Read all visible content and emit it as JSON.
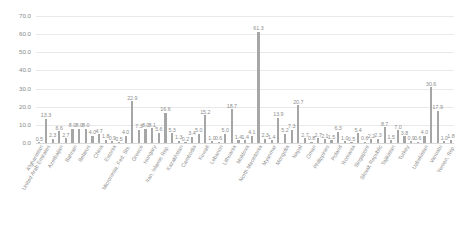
{
  "chart_data": {
    "type": "bar",
    "title": "",
    "subtitle": "",
    "xlabel": "",
    "ylabel": "",
    "ylim": [
      0,
      70
    ],
    "yticks": [
      "0.0",
      "10.0",
      "20.0",
      "30.0",
      "40.0",
      "50.0",
      "60.0",
      "70.0"
    ],
    "ytick_values": [
      0,
      10,
      20,
      30,
      40,
      50,
      60,
      70
    ],
    "grid": true,
    "legend": "none",
    "bar_color": "#a6a6a6",
    "grid_color": "#e9e9e9",
    "label_color": "#8d8d8d",
    "categories": [
      "Afghanistan",
      "United Arab Emirates",
      "Azerbaijan",
      "Bahrain",
      "Belarus",
      "China",
      "Estonia",
      "Micronesia, Fed. Sts.",
      "Greece",
      "Hungary",
      "Iran, Islamic Rep.",
      "Kazakhstan",
      "Cambodia",
      "Kuwait",
      "Lebanon",
      "Lithuania",
      "Moldova",
      "North Macedonia",
      "Myanmar",
      "Mongolia",
      "Nepal",
      "Oman",
      "Philippines",
      "Poland",
      "Romania",
      "Singapore",
      "Slovak Republic",
      "Tajikistan",
      "Turkey",
      "Uzbekistan",
      "Vanuatu",
      "Yemen, Rep."
    ],
    "values": [
      0.5,
      13.3,
      2.3,
      6.6,
      2.7,
      8.0,
      8.0,
      4.7,
      1.8,
      0.9,
      0.5,
      4.0,
      7.3,
      22.9,
      8.0,
      5.1,
      5.6,
      16.6,
      5.3,
      1.3,
      0.2,
      3.4,
      15.2,
      1.0,
      0.6,
      5.0,
      18.7,
      1.4,
      1.4,
      4.1,
      61.3,
      2.3
    ],
    "bars": [
      {
        "category": "Afghanistan",
        "value": 0.5,
        "label": "0.5"
      },
      {
        "category": "United Arab Emirates",
        "value": 13.3,
        "label": "13.3"
      },
      {
        "category": "Azerbaijan",
        "value": 2.3,
        "label": "2.3"
      },
      {
        "category": "Bahrain",
        "value": 6.6,
        "label": "6.6"
      },
      {
        "category": "Belarus",
        "value": 2.7,
        "label": "2.7"
      },
      {
        "category": "China",
        "value": 8.0,
        "label": "8.0"
      },
      {
        "category": "Estonia",
        "value": 8.0,
        "label": "8.0"
      },
      {
        "category": "Micronesia, Fed. Sts.",
        "value": 4.7,
        "label": "4.7"
      },
      {
        "category": "Greece",
        "value": 1.8,
        "label": "1.8"
      },
      {
        "category": "Hungary",
        "value": 0.9,
        "label": "0.9"
      },
      {
        "category": "Iran, Islamic Rep.",
        "value": 0.5,
        "label": "0.5"
      },
      {
        "category": "Kazakhstan",
        "value": 4.0,
        "label": "4.0"
      },
      {
        "category": "Cambodia",
        "value": 7.3,
        "label": "7.3"
      },
      {
        "category": "Kuwait",
        "value": 22.9,
        "label": "22.9"
      },
      {
        "category": "Lebanon",
        "value": 8.0,
        "label": "8.0"
      },
      {
        "category": "Lithuania",
        "value": 5.1,
        "label": "5.1"
      },
      {
        "category": "Moldova",
        "value": 5.6,
        "label": "5.6"
      },
      {
        "category": "North Macedonia",
        "value": 16.6,
        "label": "16.6"
      },
      {
        "category": "Myanmar",
        "value": 5.3,
        "label": "5.3"
      },
      {
        "category": "Mongolia",
        "value": 1.3,
        "label": "1.3"
      },
      {
        "category": "Nepal",
        "value": 0.2,
        "label": "0.2"
      },
      {
        "category": "Oman",
        "value": 3.4,
        "label": "3.4"
      },
      {
        "category": "Philippines",
        "value": 15.2,
        "label": "15.2"
      },
      {
        "category": "Poland",
        "value": 1.0,
        "label": "1.0"
      },
      {
        "category": "Romania",
        "value": 0.6,
        "label": "0.6"
      },
      {
        "category": "Singapore",
        "value": 5.0,
        "label": "5.0"
      },
      {
        "category": "Slovak Republic",
        "value": 18.7,
        "label": "18.7"
      },
      {
        "category": "Tajikistan",
        "value": 1.4,
        "label": "1.4"
      },
      {
        "category": "Turkey",
        "value": 1.4,
        "label": "1.4"
      },
      {
        "category": "Uzbekistan",
        "value": 4.1,
        "label": "4.1"
      },
      {
        "category": "Vanuatu",
        "value": 61.3,
        "label": "61.3"
      },
      {
        "category": "Yemen, Rep.",
        "value": 2.3,
        "label": "2.3"
      }
    ],
    "extra_bars": [
      {
        "value": 1.4,
        "label": "1.4"
      },
      {
        "value": 13.9,
        "label": "13.9"
      },
      {
        "value": 5.2,
        "label": "5.2"
      },
      {
        "value": 7.3,
        "label": "7.3"
      },
      {
        "value": 20.7,
        "label": "20.7"
      },
      {
        "value": 2.7,
        "label": "2.7"
      },
      {
        "value": 0.8,
        "label": "0.8"
      },
      {
        "value": 2.7,
        "label": "2.7"
      },
      {
        "value": 2.1,
        "label": "2.1"
      },
      {
        "value": 1.5,
        "label": "1.5"
      },
      {
        "value": 6.3,
        "label": "6.3"
      },
      {
        "value": 1.0,
        "label": "1.0"
      },
      {
        "value": 0.5,
        "label": "0.5"
      },
      {
        "value": 5.4,
        "label": "5.4"
      },
      {
        "value": 0.6,
        "label": "0.6"
      },
      {
        "value": 2.2,
        "label": "2.2"
      },
      {
        "value": 2.3,
        "label": "2.3"
      },
      {
        "value": 8.7,
        "label": "8.7"
      },
      {
        "value": 1.5,
        "label": "1.5"
      },
      {
        "value": 7.0,
        "label": "7.0"
      },
      {
        "value": 3.8,
        "label": "3.8"
      },
      {
        "value": 0.9,
        "label": "0.9"
      },
      {
        "value": 0.6,
        "label": "0.6"
      },
      {
        "value": 4.0,
        "label": "4.0"
      },
      {
        "value": 30.6,
        "label": "30.6"
      },
      {
        "value": 17.9,
        "label": "17.9"
      },
      {
        "value": 1.8,
        "label": "1.8"
      }
    ],
    "full_series": [
      {
        "category": "Afghanistan",
        "value": 0.5,
        "label": "0.5"
      },
      {
        "category": "United Arab Emirates",
        "value": 13.3,
        "label": "13.3"
      },
      {
        "category": "",
        "value": 2.3,
        "label": "2.3"
      },
      {
        "category": "Azerbaijan",
        "value": 6.6,
        "label": "6.6"
      },
      {
        "category": "",
        "value": 2.7,
        "label": "2.7"
      },
      {
        "category": "Bahrain",
        "value": 8.0,
        "label": "8.0"
      },
      {
        "category": "",
        "value": 8.0,
        "label": "8.0"
      },
      {
        "category": "Belarus",
        "value": 8.0,
        "label": "8.0"
      },
      {
        "category": "",
        "value": 4.0,
        "label": "4.0"
      },
      {
        "category": "China",
        "value": 4.7,
        "label": "4.7"
      },
      {
        "category": "",
        "value": 1.8,
        "label": "1.8"
      },
      {
        "category": "Estonia",
        "value": 0.9,
        "label": "0.9"
      },
      {
        "category": "",
        "value": 0.5,
        "label": "0.5"
      },
      {
        "category": "Micronesia, Fed. Sts.",
        "value": 4.0,
        "label": "4.0"
      },
      {
        "category": "",
        "value": 22.9,
        "label": "22.9"
      },
      {
        "category": "Greece",
        "value": 7.3,
        "label": "7.3"
      },
      {
        "category": "",
        "value": 8.0,
        "label": "8.0"
      },
      {
        "category": "Hungary",
        "value": 8.1,
        "label": "8.1"
      },
      {
        "category": "",
        "value": 5.6,
        "label": "5.6"
      },
      {
        "category": "Iran, Islamic Rep.",
        "value": 16.6,
        "label": "16.6"
      },
      {
        "category": "",
        "value": 5.3,
        "label": "5.3"
      },
      {
        "category": "Kazakhstan",
        "value": 1.3,
        "label": "1.3"
      },
      {
        "category": "",
        "value": 0.2,
        "label": "0.2"
      },
      {
        "category": "Cambodia",
        "value": 3.4,
        "label": "3.4"
      },
      {
        "category": "",
        "value": 5.0,
        "label": "5.0"
      },
      {
        "category": "Kuwait",
        "value": 15.2,
        "label": "15.2"
      },
      {
        "category": "",
        "value": 1.0,
        "label": "1.0"
      },
      {
        "category": "Lebanon",
        "value": 0.6,
        "label": "0.6"
      },
      {
        "category": "",
        "value": 5.0,
        "label": "5.0"
      },
      {
        "category": "Lithuania",
        "value": 18.7,
        "label": "18.7"
      },
      {
        "category": "",
        "value": 1.4,
        "label": "1.4"
      },
      {
        "category": "Moldova",
        "value": 1.4,
        "label": "1.4"
      },
      {
        "category": "",
        "value": 4.1,
        "label": "4.1"
      },
      {
        "category": "North Macedonia",
        "value": 61.3,
        "label": "61.3"
      },
      {
        "category": "",
        "value": 2.3,
        "label": "2.3"
      },
      {
        "category": "Myanmar",
        "value": 1.4,
        "label": "1.4"
      },
      {
        "category": "",
        "value": 13.9,
        "label": "13.9"
      },
      {
        "category": "Mongolia",
        "value": 5.2,
        "label": "5.2"
      },
      {
        "category": "",
        "value": 7.3,
        "label": "7.3"
      },
      {
        "category": "Nepal",
        "value": 20.7,
        "label": "20.7"
      },
      {
        "category": "",
        "value": 2.7,
        "label": "2.7"
      },
      {
        "category": "Oman",
        "value": 0.8,
        "label": "0.8"
      },
      {
        "category": "",
        "value": 2.7,
        "label": "2.7"
      },
      {
        "category": "Philippines",
        "value": 2.1,
        "label": "2.1"
      },
      {
        "category": "",
        "value": 1.5,
        "label": "1.5"
      },
      {
        "category": "Poland",
        "value": 6.3,
        "label": "6.3"
      },
      {
        "category": "",
        "value": 1.0,
        "label": "1.0"
      },
      {
        "category": "Romania",
        "value": 0.5,
        "label": "0.5"
      },
      {
        "category": "",
        "value": 5.4,
        "label": "5.4"
      },
      {
        "category": "Singapore",
        "value": 0.6,
        "label": "0.6"
      },
      {
        "category": "",
        "value": 2.2,
        "label": "2.2"
      },
      {
        "category": "Slovak Republic",
        "value": 2.3,
        "label": "2.3"
      },
      {
        "category": "",
        "value": 8.7,
        "label": "8.7"
      },
      {
        "category": "Tajikistan",
        "value": 1.5,
        "label": "1.5"
      },
      {
        "category": "",
        "value": 7.0,
        "label": "7.0"
      },
      {
        "category": "Turkey",
        "value": 3.8,
        "label": "3.8"
      },
      {
        "category": "",
        "value": 0.9,
        "label": "0.9"
      },
      {
        "category": "",
        "value": 0.6,
        "label": "0.6"
      },
      {
        "category": "Uzbekistan",
        "value": 4.0,
        "label": "4.0"
      },
      {
        "category": "",
        "value": 30.6,
        "label": "30.6"
      },
      {
        "category": "Vanuatu",
        "value": 17.9,
        "label": "17.9"
      },
      {
        "category": "",
        "value": 1.0,
        "label": "1.0"
      },
      {
        "category": "Yemen, Rep.",
        "value": 1.8,
        "label": "1.8"
      }
    ]
  }
}
